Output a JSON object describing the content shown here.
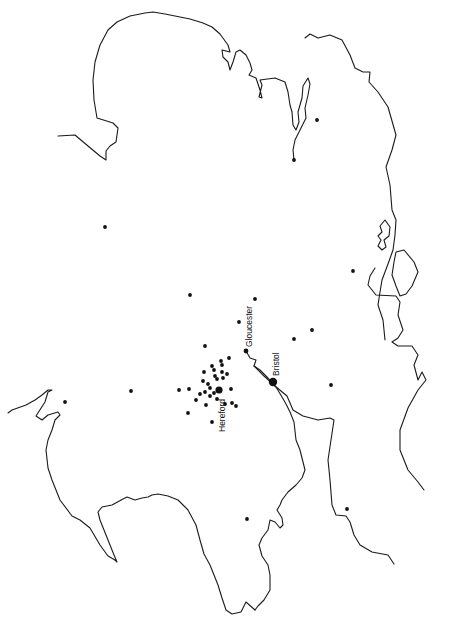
{
  "map": {
    "orientation": "rotated-90-ccw",
    "colors": {
      "background": "#ffffff",
      "ink": "#111111"
    },
    "cities": [
      {
        "name": "Gloucester",
        "x": 246,
        "y": 351,
        "r": 2.4,
        "label_x": 252,
        "label_y": 347,
        "rotate": -90
      },
      {
        "name": "Bristol",
        "x": 273,
        "y": 382,
        "r": 4.2,
        "label_x": 279,
        "label_y": 376,
        "rotate": -90
      },
      {
        "name": "Hereford",
        "x": 219,
        "y": 390,
        "r": 3.6,
        "label_x": 225,
        "label_y": 432,
        "rotate": -90
      }
    ],
    "points": [
      [
        317,
        120
      ],
      [
        294,
        160
      ],
      [
        105,
        227
      ],
      [
        353,
        271
      ],
      [
        190,
        295
      ],
      [
        255,
        299
      ],
      [
        312,
        330
      ],
      [
        239,
        322
      ],
      [
        294,
        339
      ],
      [
        205,
        346
      ],
      [
        229,
        358
      ],
      [
        331,
        385
      ],
      [
        65,
        402
      ],
      [
        131,
        391
      ],
      [
        179,
        390
      ],
      [
        189,
        389
      ],
      [
        204,
        372
      ],
      [
        203,
        381
      ],
      [
        212,
        366
      ],
      [
        214,
        370
      ],
      [
        221,
        361
      ],
      [
        222,
        365
      ],
      [
        215,
        376
      ],
      [
        217,
        379
      ],
      [
        222,
        372
      ],
      [
        223,
        378
      ],
      [
        227,
        374
      ],
      [
        231,
        389
      ],
      [
        208,
        384
      ],
      [
        210,
        388
      ],
      [
        205,
        392
      ],
      [
        210,
        396
      ],
      [
        214,
        393
      ],
      [
        217,
        399
      ],
      [
        200,
        394
      ],
      [
        196,
        400
      ],
      [
        206,
        405
      ],
      [
        225,
        404
      ],
      [
        232,
        403
      ],
      [
        236,
        406
      ],
      [
        188,
        413
      ],
      [
        212,
        422
      ],
      [
        247,
        519
      ],
      [
        347,
        509
      ]
    ]
  }
}
